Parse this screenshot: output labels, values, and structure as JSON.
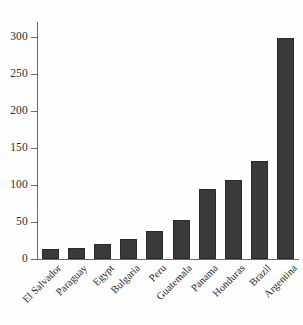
{
  "chart_data": {
    "type": "bar",
    "title": "",
    "subtitle": "",
    "xlabel": "",
    "ylabel": "",
    "categories": [
      "El Salvador",
      "Paraguay",
      "Egypt",
      "Bulgaria",
      "Peru",
      "Guatemala",
      "Panama",
      "Honduras",
      "Brazil",
      "Argentina"
    ],
    "values": [
      13,
      15,
      20,
      27,
      38,
      53,
      94,
      107,
      132,
      298
    ],
    "ylim": [
      0,
      320
    ],
    "yticks": [
      0,
      50,
      100,
      150,
      200,
      250,
      300
    ],
    "ytick_labels": [
      "0",
      "50",
      "100",
      "150",
      "200",
      "250",
      "300"
    ],
    "grid": false,
    "legend": null,
    "legend_position": "none",
    "bar_color": "#3a3a3a",
    "axis_color": "#6b6b6b",
    "background_color": "#fefefe",
    "annotations": []
  }
}
